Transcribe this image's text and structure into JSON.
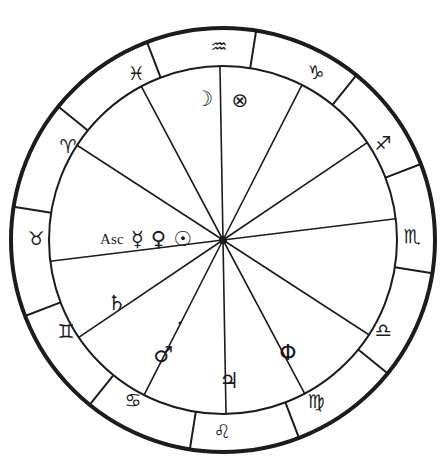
{
  "chart": {
    "type": "zodiac-wheel",
    "center": {
      "x": 223,
      "y": 240
    },
    "radii": {
      "outer": 212,
      "inner": 174,
      "hub": 4
    },
    "stroke_color": "#1b1b20",
    "background_color": "#ffffff",
    "outer_ring_stroke_width": 4,
    "inner_ring_stroke_width": 2,
    "cusp_stroke_width": 1.6,
    "ascendant_offset_degrees": 186
  },
  "zodiac_signs": [
    {
      "name": "taurus",
      "glyph": "♉",
      "label": "Taurus",
      "ring_angle": 186,
      "x": 36,
      "y": 238
    },
    {
      "name": "aries",
      "glyph": "♈",
      "label": "Aries",
      "ring_angle": 216,
      "x": 68,
      "y": 146
    },
    {
      "name": "pisces",
      "glyph": "♓",
      "label": "Pisces",
      "ring_angle": 246,
      "x": 136,
      "y": 73
    },
    {
      "name": "aquarius",
      "glyph": "♒",
      "label": "Aquarius",
      "ring_angle": 276,
      "x": 219,
      "y": 46
    },
    {
      "name": "capricorn",
      "glyph": "♑",
      "label": "Capricorn",
      "ring_angle": 306,
      "x": 316,
      "y": 72
    },
    {
      "name": "sagittarius",
      "glyph": "♐",
      "label": "Sagittarius",
      "ring_angle": 336,
      "x": 383,
      "y": 143
    },
    {
      "name": "scorpio",
      "glyph": "♏",
      "label": "Scorpio",
      "ring_angle": 6,
      "x": 412,
      "y": 236
    },
    {
      "name": "libra",
      "glyph": "♎",
      "label": "Libra",
      "ring_angle": 36,
      "x": 383,
      "y": 330
    },
    {
      "name": "virgo",
      "glyph": "♍",
      "label": "Virgo",
      "ring_angle": 66,
      "x": 316,
      "y": 401
    },
    {
      "name": "leo",
      "glyph": "♌",
      "label": "Leo",
      "ring_angle": 96,
      "x": 222,
      "y": 431
    },
    {
      "name": "cancer",
      "glyph": "♋",
      "label": "Cancer",
      "ring_angle": 126,
      "x": 133,
      "y": 400
    },
    {
      "name": "gemini",
      "glyph": "♊",
      "label": "Gemini",
      "ring_angle": 156,
      "x": 66,
      "y": 331
    }
  ],
  "house_cusps": [
    {
      "name": "cusp-1-ascendant",
      "angle": 187
    },
    {
      "name": "cusp-2",
      "angle": 214
    },
    {
      "name": "cusp-3",
      "angle": 243
    },
    {
      "name": "cusp-4",
      "angle": 271
    },
    {
      "name": "cusp-5",
      "angle": 298
    },
    {
      "name": "cusp-6",
      "angle": 327
    },
    {
      "name": "cusp-7-descendant",
      "angle": 7
    },
    {
      "name": "cusp-8",
      "angle": 34
    },
    {
      "name": "cusp-9",
      "angle": 63
    },
    {
      "name": "cusp-10-midheaven",
      "angle": 91
    },
    {
      "name": "cusp-11",
      "angle": 118
    },
    {
      "name": "cusp-12",
      "angle": 147
    }
  ],
  "placements": [
    {
      "name": "moon",
      "glyph": "☽",
      "label": "Moon",
      "sign": "Aquarius",
      "x": 204,
      "y": 99,
      "font_size": 21
    },
    {
      "name": "part-of-fortune",
      "glyph": "⊗",
      "label": "Part of Fortune",
      "sign": "Aquarius",
      "x": 240,
      "y": 100,
      "font_size": 20
    },
    {
      "name": "saturn",
      "glyph": "♄",
      "label": "Saturn",
      "sign": "Gemini",
      "x": 117,
      "y": 303,
      "font_size": 21
    },
    {
      "name": "mars",
      "glyph": "♂",
      "label": "Mars",
      "sign": "Cancer",
      "x": 163,
      "y": 355,
      "font_size": 22
    },
    {
      "name": "jupiter",
      "glyph": "♃",
      "label": "Jupiter",
      "sign": "Leo",
      "x": 229,
      "y": 381,
      "font_size": 22
    },
    {
      "name": "phi-point",
      "glyph": "Φ",
      "label": "Phi Point",
      "sign": "Virgo",
      "x": 288,
      "y": 353,
      "font_size": 22
    }
  ],
  "ascendant_row": {
    "name": "ascendant-group",
    "sign": "Taurus",
    "x": 146,
    "y": 239,
    "items": [
      {
        "name": "ascendant-label",
        "glyph": "Asc",
        "label": "Ascendant",
        "kind": "text",
        "font_size": 15
      },
      {
        "name": "mercury",
        "glyph": "☿",
        "label": "Mercury",
        "kind": "glyph",
        "font_size": 21
      },
      {
        "name": "venus",
        "glyph": "♀",
        "label": "Venus",
        "kind": "glyph",
        "font_size": 21
      },
      {
        "name": "sun",
        "glyph": "☉",
        "label": "Sun",
        "kind": "glyph",
        "font_size": 21
      }
    ]
  },
  "marks": [
    {
      "name": "retrograde-dot",
      "x": 180,
      "y": 323,
      "label": "small dot above Mars"
    }
  ],
  "chart_data": {
    "type": "pie",
    "xlabel": "",
    "ylabel": "",
    "categories": [
      "Taurus",
      "Aries",
      "Pisces",
      "Aquarius",
      "Capricorn",
      "Sagittarius",
      "Scorpio",
      "Libra",
      "Virgo",
      "Leo",
      "Cancer",
      "Gemini"
    ],
    "values": [
      30,
      30,
      30,
      30,
      30,
      30,
      30,
      30,
      30,
      30,
      30,
      30
    ],
    "legend_position": "none",
    "grid": false,
    "annotations": [
      "Aquarius sector contains Moon and Part of Fortune",
      "Taurus sector contains Asc, Mercury, Venus and Sun",
      "Gemini sector contains Saturn",
      "Cancer sector contains Mars with a dot",
      "Leo sector contains Jupiter",
      "Virgo sector contains Phi point"
    ]
  }
}
